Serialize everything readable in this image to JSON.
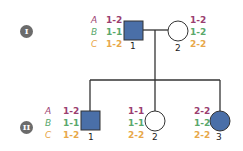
{
  "colors": {
    "A": "#9b3e6f",
    "B": "#5aa86b",
    "C": "#e8a84a",
    "affected_fill": "#4a6fa8",
    "line": "#333333",
    "gen_badge": "#6b6b6b"
  },
  "loci": [
    "A",
    "B",
    "C"
  ],
  "generations": [
    {
      "label": "I",
      "individuals": [
        {
          "id": "1",
          "sex": "male",
          "affected": true,
          "genotypes": {
            "A": "1-2",
            "B": "1-1",
            "C": "1-2"
          }
        },
        {
          "id": "2",
          "sex": "female",
          "affected": false,
          "genotypes": {
            "A": "1-2",
            "B": "1-2",
            "C": "2-2"
          }
        }
      ]
    },
    {
      "label": "II",
      "individuals": [
        {
          "id": "1",
          "sex": "male",
          "affected": true,
          "genotypes": {
            "A": "1-2",
            "B": "1-1",
            "C": "1-2"
          }
        },
        {
          "id": "2",
          "sex": "female",
          "affected": false,
          "genotypes": {
            "A": "1-1",
            "B": "1-1",
            "C": "2-2"
          }
        },
        {
          "id": "3",
          "sex": "female",
          "affected": true,
          "genotypes": {
            "A": "2-2",
            "B": "1-2",
            "C": "2-2"
          }
        }
      ]
    }
  ]
}
